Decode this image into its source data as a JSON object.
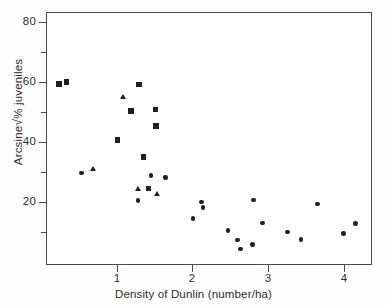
{
  "chart_data": {
    "type": "scatter",
    "title": "",
    "xlabel": "Density of Dunlin (number/ha)",
    "ylabel": "Arcsine√% juveniles",
    "xlim": [
      0,
      4.32
    ],
    "ylim": [
      0,
      83.5
    ],
    "xticks": [
      1,
      2,
      3,
      4
    ],
    "yticks": [
      20,
      40,
      60,
      80
    ],
    "ytick_minor": [
      10,
      30,
      50,
      70
    ],
    "grid": false,
    "legend": "none",
    "frame": "box",
    "series": [
      {
        "name": "square-markers",
        "marker": "square",
        "color": "#231f20",
        "points": [
          {
            "x": 0.17,
            "y": 59.7
          },
          {
            "x": 0.27,
            "y": 60.4
          },
          {
            "x": 1.23,
            "y": 59.6
          },
          {
            "x": 1.13,
            "y": 50.9
          },
          {
            "x": 1.45,
            "y": 51.3
          },
          {
            "x": 1.46,
            "y": 45.9
          },
          {
            "x": 0.95,
            "y": 41.2
          },
          {
            "x": 1.29,
            "y": 35.6
          },
          {
            "x": 1.36,
            "y": 25.3
          }
        ]
      },
      {
        "name": "triangle-markers",
        "marker": "triangle",
        "color": "#231f20",
        "points": [
          {
            "x": 1.02,
            "y": 55.4
          },
          {
            "x": 0.63,
            "y": 31.7
          },
          {
            "x": 1.23,
            "y": 24.8
          },
          {
            "x": 1.48,
            "y": 23.4
          }
        ]
      },
      {
        "name": "circle-markers",
        "marker": "circle",
        "color": "#231f20",
        "points": [
          {
            "x": 0.47,
            "y": 30.4
          },
          {
            "x": 1.39,
            "y": 29.6
          },
          {
            "x": 1.58,
            "y": 28.9
          },
          {
            "x": 1.22,
            "y": 21.3
          },
          {
            "x": 2.06,
            "y": 20.8
          },
          {
            "x": 2.08,
            "y": 19.0
          },
          {
            "x": 1.95,
            "y": 15.3
          },
          {
            "x": 2.75,
            "y": 21.4
          },
          {
            "x": 2.87,
            "y": 13.8
          },
          {
            "x": 2.41,
            "y": 11.4
          },
          {
            "x": 2.54,
            "y": 8.2
          },
          {
            "x": 2.58,
            "y": 5.3
          },
          {
            "x": 2.74,
            "y": 6.8
          },
          {
            "x": 3.2,
            "y": 10.9
          },
          {
            "x": 3.38,
            "y": 8.5
          },
          {
            "x": 3.6,
            "y": 20.2
          },
          {
            "x": 3.94,
            "y": 10.4
          },
          {
            "x": 4.1,
            "y": 13.6
          }
        ]
      }
    ]
  },
  "axes": {
    "x_title": "Density of Dunlin (number/ha)",
    "y_title_pre": "Arcsine",
    "y_title_radical": "√",
    "y_title_post": "% juveniles",
    "x_tick_labels": [
      "1",
      "2",
      "3",
      "4"
    ],
    "y_tick_labels": [
      "20",
      "40",
      "60",
      "80"
    ]
  },
  "colors": {
    "marker": "#231f20",
    "axis": "#4a4a4a",
    "text": "#2b2b2b",
    "background": "#ffffff"
  }
}
